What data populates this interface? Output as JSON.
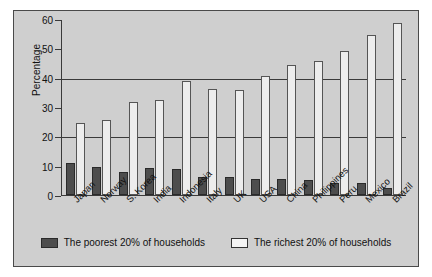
{
  "chart_data": {
    "type": "bar",
    "title": "",
    "xlabel": "",
    "ylabel": "Percentage",
    "ylim": [
      0,
      60
    ],
    "yticks": [
      0,
      10,
      20,
      30,
      40,
      50,
      60
    ],
    "gridlines": [
      20,
      40
    ],
    "grid": true,
    "legend_position": "bottom",
    "categories": [
      "Japan",
      "Norway",
      "S. Korea",
      "India",
      "Indonesia",
      "Italy",
      "UK",
      "USA",
      "China",
      "Philippines",
      "Peru",
      "Mexico",
      "Brazil"
    ],
    "series": [
      {
        "name": "The poorest 20% of households",
        "color": "#4d4d4d",
        "values": [
          10.9,
          9.5,
          8.0,
          9.3,
          8.8,
          6.2,
          6.2,
          5.3,
          5.5,
          5.1,
          4.2,
          4.0,
          2.5
        ]
      },
      {
        "name": "The richest 20% of households",
        "color": "#ededed",
        "values": [
          24.7,
          25.6,
          31.7,
          32.4,
          39.0,
          36.3,
          35.8,
          40.6,
          44.3,
          45.6,
          49.0,
          54.5,
          58.7
        ]
      }
    ]
  },
  "legend": {
    "poorest_label": "The poorest 20% of households",
    "richest_label": "The richest 20% of households"
  }
}
